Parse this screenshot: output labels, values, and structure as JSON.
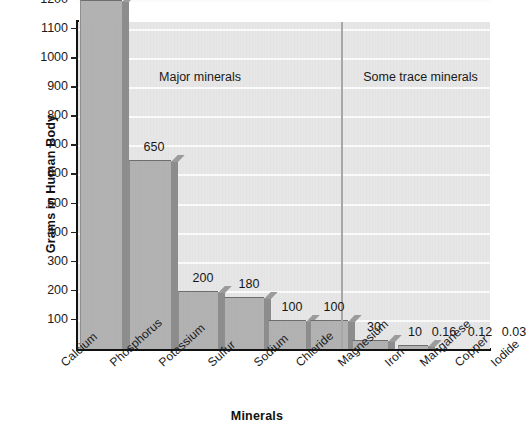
{
  "chart_data": {
    "type": "bar",
    "title": "",
    "xlabel": "Minerals",
    "ylabel": "Grams in Human Body",
    "categories": [
      "Calcium",
      "Phosphorus",
      "Potassium",
      "Sulfur",
      "Sodium",
      "Chloride",
      "Magnesium",
      "Iron",
      "Manganese",
      "Copper",
      "Iodide"
    ],
    "values": [
      1200,
      650,
      200,
      180,
      100,
      100,
      30,
      10,
      0.16,
      0.12,
      0.03
    ],
    "value_labels": [
      "1200",
      "650",
      "200",
      "180",
      "100",
      "100",
      "30",
      "10",
      "0.16",
      "0.12",
      "0.03"
    ],
    "ylim": [
      0,
      1250
    ],
    "ytick_labels": [
      "100",
      "200",
      "300",
      "400",
      "500",
      "600",
      "700",
      "800",
      "900",
      "1000",
      "1100",
      "1200"
    ],
    "ytick_values": [
      100,
      200,
      300,
      400,
      500,
      600,
      700,
      800,
      900,
      1000,
      1100,
      1200
    ],
    "grid": "horizontal",
    "legend": "none",
    "annotations": [
      {
        "text": "Major minerals",
        "region": "left-of-divider"
      },
      {
        "text": "Some trace minerals",
        "region": "right-of-divider"
      }
    ],
    "divider_after_category": "Magnesium",
    "colors": {
      "bar_face": "#b2b2b2",
      "bar_side": "#8d8d8d",
      "plot_background": "#e6e6e6",
      "gridline": "#fbfbfb",
      "axis": "#111111",
      "divider": "#a8a8a8",
      "text": "#1a1a1a"
    }
  },
  "axes": {
    "y_title": "Grams in Human Body",
    "x_title": "Minerals"
  },
  "groups": {
    "major": "Major minerals",
    "trace": "Some trace minerals"
  }
}
